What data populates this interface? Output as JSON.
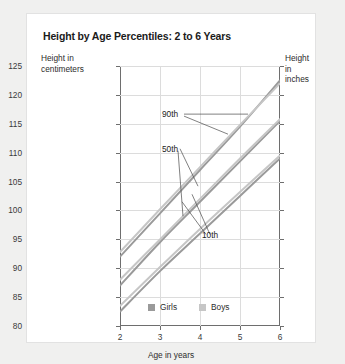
{
  "card": {
    "title": "Height by Age Percentiles: 2 to 6 Years"
  },
  "axes": {
    "y_left_title": "Height in\ncentimeters",
    "y_right_title": "Height\nin inches",
    "x_title": "Age in years"
  },
  "legend": {
    "items": [
      {
        "label": "Girls",
        "color": "#9a9a9a"
      },
      {
        "label": "Boys",
        "color": "#c6c6c6"
      }
    ]
  },
  "annotations": [
    {
      "label": "90th"
    },
    {
      "label": "50th"
    },
    {
      "label": "10th"
    }
  ],
  "chart_data": {
    "type": "line",
    "title": "Height by Age Percentiles: 2 to 6 Years",
    "xlabel": "Age in years",
    "ylabel": "Height in centimeters",
    "ylabel_secondary": "Height in inches",
    "xlim": [
      2,
      6
    ],
    "ylim": [
      80,
      125
    ],
    "ylim_secondary": [
      31.5,
      49.2
    ],
    "grid": true,
    "legend_position": "bottom-center",
    "x": [
      2,
      3,
      4,
      5,
      6
    ],
    "xticks": [
      2,
      3,
      4,
      5,
      6
    ],
    "yticks": [
      80,
      85,
      90,
      95,
      100,
      105,
      110,
      115,
      120,
      125
    ],
    "yticks_secondary": [
      31.5,
      33.5,
      35.4,
      37.4,
      39.4,
      41.3,
      43.3,
      45.3,
      47.2,
      49.2
    ],
    "series": [
      {
        "name": "Girls 90th",
        "percentile": "90th",
        "sex": "Girls",
        "color": "#9a9a9a",
        "values": [
          92.0,
          99.5,
          107.0,
          114.5,
          122.5
        ]
      },
      {
        "name": "Boys 90th",
        "percentile": "90th",
        "sex": "Boys",
        "color": "#c6c6c6",
        "values": [
          92.8,
          100.2,
          107.5,
          114.8,
          122.0
        ]
      },
      {
        "name": "Girls 50th",
        "percentile": "50th",
        "sex": "Girls",
        "color": "#9a9a9a",
        "values": [
          87.0,
          94.5,
          101.5,
          108.5,
          115.5
        ]
      },
      {
        "name": "Boys 50th",
        "percentile": "50th",
        "sex": "Boys",
        "color": "#c6c6c6",
        "values": [
          88.0,
          95.0,
          102.0,
          109.0,
          115.8
        ]
      },
      {
        "name": "Girls 10th",
        "percentile": "10th",
        "sex": "Girls",
        "color": "#9a9a9a",
        "values": [
          82.5,
          89.5,
          96.0,
          102.5,
          109.0
        ]
      },
      {
        "name": "Boys 10th",
        "percentile": "10th",
        "sex": "Boys",
        "color": "#c6c6c6",
        "values": [
          83.5,
          90.2,
          96.8,
          103.2,
          109.5
        ]
      }
    ],
    "annotations": [
      {
        "text": "90th",
        "x": 3.1,
        "y": 116.5
      },
      {
        "text": "50th",
        "x": 3.1,
        "y": 110.5
      },
      {
        "text": "10th",
        "x": 4.1,
        "y": 95.5
      }
    ]
  }
}
